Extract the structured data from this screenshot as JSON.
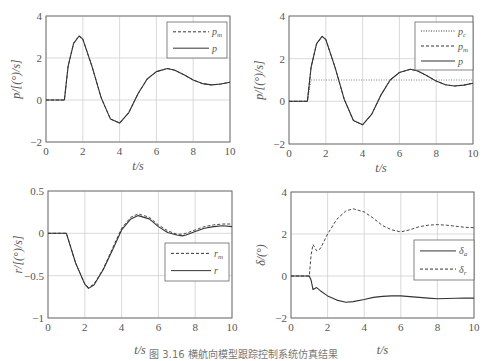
{
  "figure": {
    "caption": "图 3.16  横航向模型跟踪控制系统仿真结果"
  },
  "chart_data": [
    {
      "type": "line",
      "panel": "top-left",
      "title": "",
      "xlabel": "t / s",
      "ylabel": "p / [(°) / s]",
      "xlim": [
        0,
        10
      ],
      "ylim": [
        -2,
        4
      ],
      "xticks": [
        "0",
        "2",
        "4",
        "6",
        "8",
        "10"
      ],
      "yticks": [
        "-2",
        "0",
        "2",
        "4"
      ],
      "grid": true,
      "legend_position": "upper right",
      "x": [
        0,
        1,
        1.2,
        1.5,
        1.8,
        2.0,
        2.5,
        3.0,
        3.5,
        4.0,
        4.5,
        5.0,
        5.5,
        6.0,
        6.6,
        7.0,
        7.5,
        8.0,
        8.5,
        9.0,
        9.5,
        10
      ],
      "series": [
        {
          "name": "p_m",
          "style": "dashed",
          "values": [
            0,
            0,
            1.6,
            2.7,
            3.05,
            2.9,
            1.6,
            0.1,
            -0.9,
            -1.1,
            -0.6,
            0.3,
            1.0,
            1.35,
            1.5,
            1.42,
            1.2,
            0.95,
            0.78,
            0.72,
            0.76,
            0.85
          ]
        },
        {
          "name": "p",
          "style": "solid",
          "values": [
            0,
            0,
            1.6,
            2.7,
            3.05,
            2.9,
            1.6,
            0.1,
            -0.9,
            -1.1,
            -0.6,
            0.3,
            1.0,
            1.35,
            1.5,
            1.42,
            1.2,
            0.95,
            0.78,
            0.72,
            0.76,
            0.85
          ]
        }
      ]
    },
    {
      "type": "line",
      "panel": "top-right",
      "title": "",
      "xlabel": "t / s",
      "ylabel": "p / [(°) / s]",
      "xlim": [
        0,
        10
      ],
      "ylim": [
        -2,
        4
      ],
      "xticks": [
        "0",
        "2",
        "4",
        "6",
        "8",
        "10"
      ],
      "yticks": [
        "-2",
        "0",
        "2",
        "4"
      ],
      "grid": true,
      "legend_position": "upper right",
      "x": [
        0,
        1,
        1.2,
        1.5,
        1.8,
        2.0,
        2.5,
        3.0,
        3.5,
        4.0,
        4.5,
        5.0,
        5.5,
        6.0,
        6.6,
        7.0,
        7.5,
        8.0,
        8.5,
        9.0,
        9.5,
        10
      ],
      "series": [
        {
          "name": "p_c",
          "style": "dotted",
          "values": [
            0,
            0,
            1,
            1,
            1,
            1,
            1,
            1,
            1,
            1,
            1,
            1,
            1,
            1,
            1,
            1,
            1,
            1,
            1,
            1,
            1,
            1
          ]
        },
        {
          "name": "p_m",
          "style": "dashed",
          "values": [
            0,
            0,
            1.6,
            2.7,
            3.05,
            2.9,
            1.6,
            0.1,
            -0.9,
            -1.1,
            -0.6,
            0.3,
            1.0,
            1.35,
            1.5,
            1.42,
            1.2,
            0.95,
            0.78,
            0.72,
            0.76,
            0.85
          ]
        },
        {
          "name": "p",
          "style": "solid",
          "values": [
            0,
            0,
            1.6,
            2.7,
            3.05,
            2.9,
            1.6,
            0.1,
            -0.9,
            -1.1,
            -0.6,
            0.3,
            1.0,
            1.35,
            1.5,
            1.42,
            1.2,
            0.95,
            0.78,
            0.72,
            0.76,
            0.85
          ]
        }
      ]
    },
    {
      "type": "line",
      "panel": "bottom-left",
      "title": "",
      "xlabel": "t / s",
      "ylabel": "r / [(°) / s]",
      "xlim": [
        0,
        10
      ],
      "ylim": [
        -1,
        0.5
      ],
      "xticks": [
        "0",
        "2",
        "4",
        "6",
        "8",
        "10"
      ],
      "yticks": [
        "-1",
        "-0.5",
        "0",
        "0.5"
      ],
      "grid": true,
      "legend_position": "center right",
      "x": [
        0,
        1,
        1.5,
        2.0,
        2.2,
        2.5,
        3.0,
        3.5,
        4.0,
        4.5,
        4.9,
        5.5,
        6.0,
        6.5,
        7.0,
        7.3,
        7.5,
        8.0,
        8.5,
        9.0,
        9.5,
        10
      ],
      "series": [
        {
          "name": "r_m",
          "style": "dashed",
          "values": [
            0,
            0,
            -0.35,
            -0.6,
            -0.64,
            -0.6,
            -0.42,
            -0.18,
            0.06,
            0.19,
            0.23,
            0.19,
            0.1,
            0.03,
            -0.01,
            -0.01,
            0.0,
            0.04,
            0.08,
            0.1,
            0.11,
            0.11
          ]
        },
        {
          "name": "r",
          "style": "solid",
          "values": [
            0,
            0,
            -0.35,
            -0.6,
            -0.65,
            -0.61,
            -0.43,
            -0.2,
            0.04,
            0.17,
            0.21,
            0.17,
            0.08,
            0.01,
            -0.02,
            -0.03,
            -0.02,
            0.02,
            0.06,
            0.08,
            0.09,
            0.08
          ]
        }
      ]
    },
    {
      "type": "line",
      "panel": "bottom-right",
      "title": "",
      "xlabel": "t / s",
      "ylabel": "δ / (°)",
      "xlim": [
        0,
        10
      ],
      "ylim": [
        -2,
        4
      ],
      "xticks": [
        "0",
        "2",
        "4",
        "6",
        "8",
        "10"
      ],
      "yticks": [
        "-2",
        "0",
        "2",
        "4"
      ],
      "grid": true,
      "legend_position": "center right",
      "x": [
        0,
        1,
        1.1,
        1.2,
        1.4,
        1.6,
        2.0,
        2.5,
        3.0,
        3.4,
        4.0,
        4.5,
        5.0,
        5.5,
        6.0,
        6.5,
        7.0,
        7.5,
        8.0,
        8.5,
        9.0,
        9.5,
        10
      ],
      "series": [
        {
          "name": "δ_a",
          "style": "solid",
          "values": [
            0,
            0,
            -0.2,
            -0.65,
            -0.55,
            -0.7,
            -0.95,
            -1.15,
            -1.25,
            -1.22,
            -1.12,
            -1.02,
            -0.97,
            -0.95,
            -0.95,
            -0.98,
            -1.02,
            -1.05,
            -1.08,
            -1.07,
            -1.06,
            -1.05,
            -1.05
          ]
        },
        {
          "name": "δ_r",
          "style": "dashed",
          "values": [
            0,
            0,
            1.0,
            1.5,
            1.2,
            1.3,
            2.0,
            2.7,
            3.1,
            3.2,
            3.05,
            2.75,
            2.4,
            2.2,
            2.1,
            2.2,
            2.35,
            2.42,
            2.45,
            2.42,
            2.37,
            2.32,
            2.3
          ]
        }
      ]
    }
  ]
}
